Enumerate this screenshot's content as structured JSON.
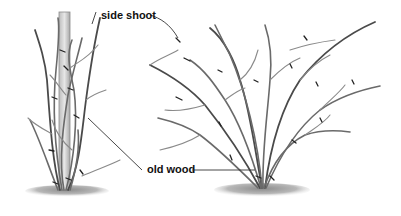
{
  "diagram": {
    "title": "",
    "labels": {
      "side_shoot": "side shoot",
      "old_wood": "old wood"
    },
    "figures": [
      {
        "name": "staked-plant",
        "description": "young plant tied to a wooden stake with pruning cuts"
      },
      {
        "name": "bush-plant",
        "description": "open spreading bush with pruning cuts marked on branches"
      }
    ],
    "colors": {
      "stroke": "#6a6a6a",
      "cut_marks": "#222222",
      "stake": "#d6d6d6",
      "ground": "#9a9a9a",
      "text": "#111111"
    }
  }
}
